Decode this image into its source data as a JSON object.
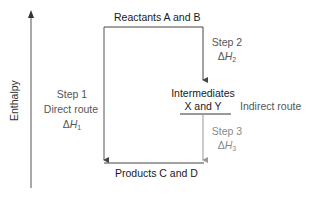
{
  "diagram": {
    "type": "enthalpy-cycle",
    "axis": {
      "label": "Enthalpy",
      "direction": "up"
    },
    "levels": {
      "reactants": "Reactants A and B",
      "intermediates_line1": "Intermediates",
      "intermediates_line2": "X and Y",
      "products": "Products C and D"
    },
    "direct_route": {
      "step": "Step 1",
      "name": "Direct route",
      "delta_symbol": "Δ",
      "var": "H",
      "sub": "1"
    },
    "indirect_route": {
      "name": "Indirect route",
      "step2": {
        "step": "Step 2",
        "delta_symbol": "Δ",
        "var": "H",
        "sub": "2"
      },
      "step3": {
        "step": "Step 3",
        "delta_symbol": "Δ",
        "var": "H",
        "sub": "3"
      }
    },
    "colors": {
      "lines_dark": "#333333",
      "text_dark": "#1a1a1a",
      "text_mid": "#555555",
      "step3_gray": "#8a8a8a"
    }
  }
}
